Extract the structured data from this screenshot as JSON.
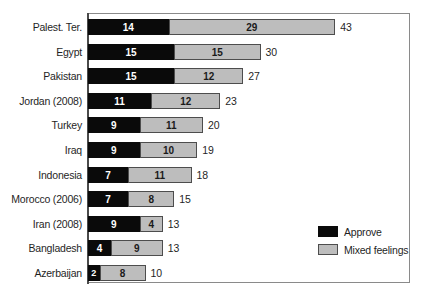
{
  "chart_data": {
    "type": "bar",
    "orientation": "horizontal",
    "stacked": true,
    "title": "",
    "subtitle": "",
    "xlabel": "",
    "ylabel": "",
    "xlim": [
      0,
      56
    ],
    "grid": false,
    "legend_position": "inside-bottom-right",
    "categories": [
      "Palest. Ter.",
      "Egypt",
      "Pakistan",
      "Jordan (2008)",
      "Turkey",
      "Iraq",
      "Indonesia",
      "Morocco (2006)",
      "Iran (2008)",
      "Bangladesh",
      "Azerbaijan"
    ],
    "series": [
      {
        "name": "Approve",
        "color": "#0a0a0a",
        "values": [
          14,
          15,
          15,
          11,
          9,
          9,
          7,
          7,
          9,
          4,
          2
        ]
      },
      {
        "name": "Mixed feelings",
        "color": "#bdbdbd",
        "values": [
          29,
          15,
          12,
          12,
          11,
          10,
          11,
          8,
          4,
          9,
          8
        ]
      }
    ],
    "totals": [
      43,
      30,
      27,
      23,
      20,
      19,
      18,
      15,
      13,
      13,
      10
    ]
  },
  "legend": {
    "items": [
      {
        "label": "Approve",
        "swatch": "approve"
      },
      {
        "label": "Mixed feelings",
        "swatch": "mixed"
      }
    ]
  }
}
